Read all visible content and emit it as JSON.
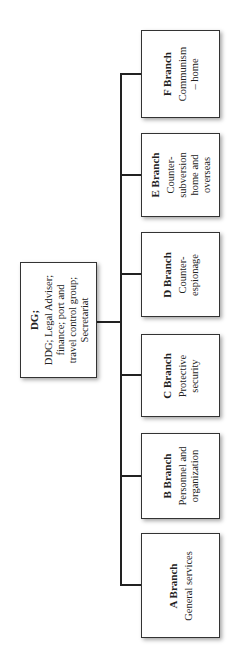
{
  "chart": {
    "root": {
      "title": "DG;",
      "lines": [
        "DDG; Legal Adviser;",
        "finance; port and",
        "travel control group;",
        "Secretariat"
      ]
    },
    "branches": [
      {
        "title": "F Branch",
        "desc": "Communism – home"
      },
      {
        "title": "E Branch",
        "desc": "Counter-subversion home and overseas"
      },
      {
        "title": "D Branch",
        "desc": "Counter-espionage"
      },
      {
        "title": "C Branch",
        "desc": "Protective security"
      },
      {
        "title": "B Branch",
        "desc": "Personnel and organization"
      },
      {
        "title": "A Branch",
        "desc": "General services"
      }
    ]
  }
}
